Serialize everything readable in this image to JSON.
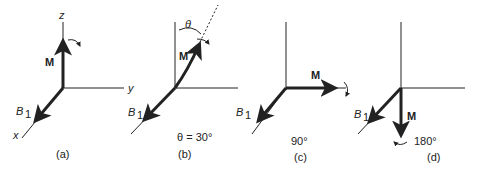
{
  "panels": [
    {
      "id": "a",
      "caption": "(a)",
      "angle_label": "",
      "axis_z": "z",
      "axis_y": "y",
      "axis_x": "x",
      "vector": "M",
      "field": "B",
      "field_sub": "1"
    },
    {
      "id": "b",
      "caption": "(b)",
      "angle_label": "θ = 30°",
      "theta": "θ",
      "vector": "M",
      "field": "B",
      "field_sub": "1"
    },
    {
      "id": "c",
      "caption": "(c)",
      "angle_label": "90°",
      "vector": "M",
      "field": "B",
      "field_sub": "1"
    },
    {
      "id": "d",
      "caption": "(d)",
      "angle_label": "180°",
      "vector": "M",
      "field": "B",
      "field_sub": "1"
    }
  ],
  "colors": {
    "line": "#222222",
    "background": "#ffffff"
  }
}
